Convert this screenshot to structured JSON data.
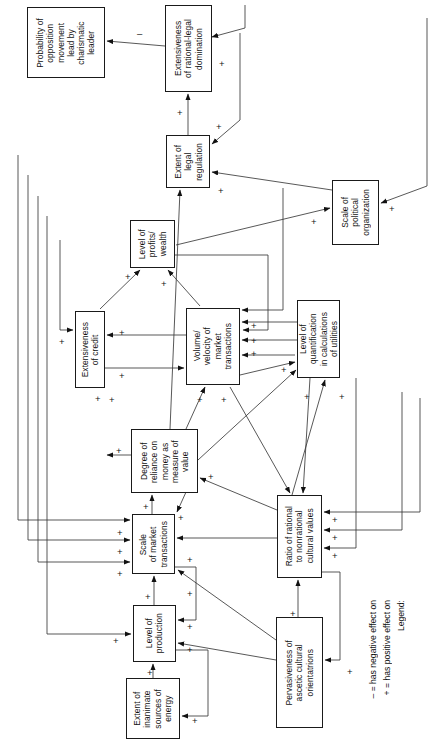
{
  "diagram": {
    "orientation": "rotated-90-ccw",
    "legend": {
      "heading": "Legend:",
      "positive": "+ = has positive effect on",
      "negative": "– = has negative effect on"
    },
    "nodes": [
      {
        "id": "opposition",
        "label": "Probability of\nopposition\nmovement\nlead by\ncharismatic\nleader",
        "x": 27,
        "y": 7,
        "w": 78,
        "h": 71
      },
      {
        "id": "rational_legal",
        "label": "Extensiveness\nof rational-legal\ndomination",
        "x": 165,
        "y": 5,
        "w": 47,
        "h": 87
      },
      {
        "id": "legal_reg",
        "label": "Extent of\nlegal\nregulation",
        "x": 166,
        "y": 135,
        "w": 44,
        "h": 53
      },
      {
        "id": "political_org",
        "label": "Scale of\npolitical\norganization",
        "x": 332,
        "y": 180,
        "w": 47,
        "h": 65
      },
      {
        "id": "profits",
        "label": "Level of\nprofits/\nwealth",
        "x": 130,
        "y": 220,
        "w": 45,
        "h": 48
      },
      {
        "id": "credit",
        "label": "Extensiveness\nof credit",
        "x": 75,
        "y": 311,
        "w": 30,
        "h": 77
      },
      {
        "id": "volume",
        "label": "Volume/\nvelocity of\nmarket\ntransactions",
        "x": 186,
        "y": 308,
        "w": 54,
        "h": 77
      },
      {
        "id": "quantification",
        "label": "Level of\nquantification\nin calculations\nof utilities",
        "x": 297,
        "y": 300,
        "w": 43,
        "h": 78
      },
      {
        "id": "money",
        "label": "Degree of\nreliance on\nmoney as\nmeasure of\nvalue",
        "x": 131,
        "y": 429,
        "w": 67,
        "h": 64
      },
      {
        "id": "market_scale",
        "label": "Scale\nof market\ntransactions",
        "x": 132,
        "y": 514,
        "w": 43,
        "h": 60
      },
      {
        "id": "ratio",
        "label": "Ratio of rational\nto nonrational\ncultural values",
        "x": 277,
        "y": 495,
        "w": 45,
        "h": 83
      },
      {
        "id": "production",
        "label": "Level of\nproduction",
        "x": 133,
        "y": 605,
        "w": 43,
        "h": 57
      },
      {
        "id": "energy",
        "label": "Extent of\ninanimate\nsources of\nenergy",
        "x": 126,
        "y": 678,
        "w": 54,
        "h": 61
      },
      {
        "id": "ascetic",
        "label": "Pervasiveness of\nascetic cultural\norientatrions",
        "x": 276,
        "y": 617,
        "w": 47,
        "h": 111
      }
    ],
    "edges": [
      {
        "from": "rational_legal",
        "to": "opposition",
        "sign": "–"
      },
      {
        "from": "legal_reg",
        "to": "rational_legal",
        "sign": "+"
      },
      {
        "from": "political_org",
        "to": "rational_legal",
        "sign": "+"
      },
      {
        "from": "rational_legal",
        "to": "legal_reg",
        "sign": "+"
      },
      {
        "from": "political_org",
        "to": "legal_reg",
        "sign": "+"
      },
      {
        "from": "rational_legal",
        "to": "political_org",
        "sign": "+"
      },
      {
        "from": "profits",
        "to": "political_org",
        "sign": "+"
      },
      {
        "from": "credit",
        "to": "profits",
        "sign": "+"
      },
      {
        "from": "volume",
        "to": "profits",
        "sign": "+"
      },
      {
        "from": "volume",
        "to": "credit",
        "sign": "+"
      },
      {
        "from": "credit",
        "to": "volume",
        "sign": "+"
      },
      {
        "from": "money",
        "to": "credit",
        "sign": "+"
      },
      {
        "from": "profits",
        "to": "volume",
        "sign": "+"
      },
      {
        "from": "legal_reg",
        "to": "volume",
        "sign": "+"
      },
      {
        "from": "quantification",
        "to": "volume",
        "sign": "+"
      },
      {
        "from": "volume",
        "to": "quantification",
        "sign": "+"
      },
      {
        "from": "money",
        "to": "volume",
        "sign": "+"
      },
      {
        "from": "market_scale",
        "to": "volume",
        "sign": "+"
      },
      {
        "from": "ratio",
        "to": "quantification",
        "sign": "+"
      },
      {
        "from": "money",
        "to": "quantification",
        "sign": "+"
      },
      {
        "from": "money",
        "to": "legal_reg",
        "sign": "+"
      },
      {
        "from": "market_scale",
        "to": "money",
        "sign": "+"
      },
      {
        "from": "ratio",
        "to": "money",
        "sign": "+"
      },
      {
        "from": "credit",
        "to": "money",
        "sign": "+"
      },
      {
        "from": "production",
        "to": "market_scale",
        "sign": "+"
      },
      {
        "from": "money",
        "to": "market_scale",
        "sign": "+"
      },
      {
        "from": "ratio",
        "to": "market_scale",
        "sign": "+"
      },
      {
        "from": "ascetic",
        "to": "market_scale",
        "sign": "+"
      },
      {
        "from": "market_scale",
        "to": "production",
        "sign": "+"
      },
      {
        "from": "ascetic",
        "to": "production",
        "sign": "+"
      },
      {
        "from": "energy",
        "to": "production",
        "sign": "+"
      },
      {
        "from": "production",
        "to": "energy",
        "sign": "+"
      },
      {
        "from": "ascetic",
        "to": "ratio",
        "sign": "+"
      },
      {
        "from": "ratio",
        "to": "ascetic",
        "sign": "+"
      },
      {
        "from": "quantification",
        "to": "ratio",
        "sign": "+"
      },
      {
        "from": "volume",
        "to": "ratio",
        "sign": "+"
      },
      {
        "from": "legal_reg",
        "to": "ratio",
        "sign": "+"
      }
    ],
    "signs": [
      {
        "t": "–",
        "x": 137,
        "y": 29
      },
      {
        "t": "+",
        "x": 177,
        "y": 108
      },
      {
        "t": "+",
        "x": 216,
        "y": 122
      },
      {
        "t": "+",
        "x": 219,
        "y": 59
      },
      {
        "t": "+",
        "x": 218,
        "y": 186
      },
      {
        "t": "+",
        "x": 389,
        "y": 204
      },
      {
        "t": "+",
        "x": 311,
        "y": 217
      },
      {
        "t": "+",
        "x": 125,
        "y": 272
      },
      {
        "t": "+",
        "x": 161,
        "y": 279
      },
      {
        "t": "+",
        "x": 119,
        "y": 328
      },
      {
        "t": "+",
        "x": 59,
        "y": 337
      },
      {
        "t": "+",
        "x": 119,
        "y": 371
      },
      {
        "t": "+",
        "x": 251,
        "y": 321
      },
      {
        "t": "+",
        "x": 251,
        "y": 336
      },
      {
        "t": "+",
        "x": 251,
        "y": 349
      },
      {
        "t": "+",
        "x": 281,
        "y": 365
      },
      {
        "t": "+",
        "x": 95,
        "y": 394
      },
      {
        "t": "+",
        "x": 109,
        "y": 395
      },
      {
        "t": "+",
        "x": 197,
        "y": 395
      },
      {
        "t": "+",
        "x": 221,
        "y": 395
      },
      {
        "t": "+",
        "x": 304,
        "y": 392
      },
      {
        "t": "+",
        "x": 339,
        "y": 392
      },
      {
        "t": "+",
        "x": 116,
        "y": 446
      },
      {
        "t": "+",
        "x": 208,
        "y": 472
      },
      {
        "t": "+",
        "x": 143,
        "y": 502
      },
      {
        "t": "+",
        "x": 178,
        "y": 513
      },
      {
        "t": "+",
        "x": 117,
        "y": 528
      },
      {
        "t": "+",
        "x": 117,
        "y": 547
      },
      {
        "t": "+",
        "x": 117,
        "y": 569
      },
      {
        "t": "+",
        "x": 187,
        "y": 555
      },
      {
        "t": "+",
        "x": 187,
        "y": 589
      },
      {
        "t": "+",
        "x": 332,
        "y": 515
      },
      {
        "t": "+",
        "x": 332,
        "y": 533
      },
      {
        "t": "+",
        "x": 332,
        "y": 551
      },
      {
        "t": "+",
        "x": 145,
        "y": 592
      },
      {
        "t": "+",
        "x": 187,
        "y": 622
      },
      {
        "t": "+",
        "x": 187,
        "y": 645
      },
      {
        "t": "+",
        "x": 113,
        "y": 636
      },
      {
        "t": "+",
        "x": 147,
        "y": 668
      },
      {
        "t": "+",
        "x": 192,
        "y": 716
      },
      {
        "t": "+",
        "x": 290,
        "y": 609
      },
      {
        "t": "+",
        "x": 347,
        "y": 667
      }
    ]
  }
}
